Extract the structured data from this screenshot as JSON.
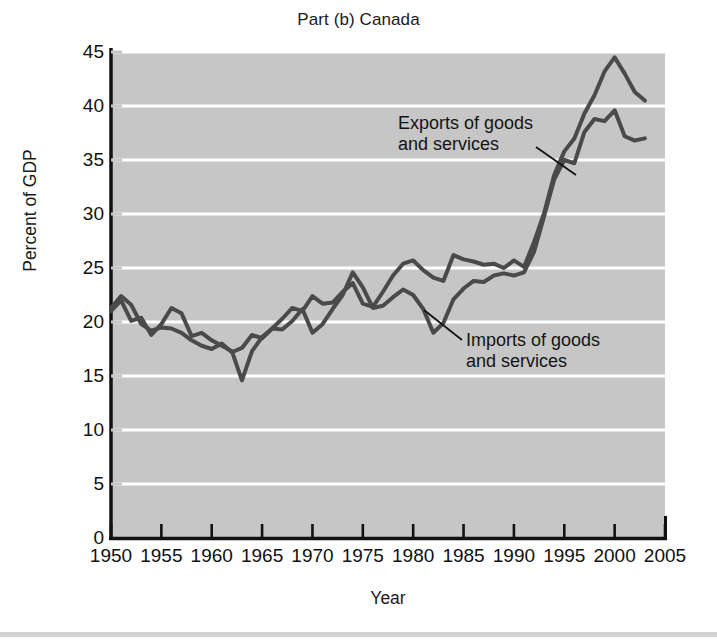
{
  "figure": {
    "title": "Part (b) Canada",
    "footer_strip_color": "#d2d2d2",
    "background_color": "#ffffff"
  },
  "annotations": {
    "exports_line1": "Exports of goods",
    "exports_line2": "and services",
    "imports_line1": "Imports of goods",
    "imports_line2": "and services"
  },
  "chart_data": {
    "type": "line",
    "title": "Part (b) Canada",
    "xlabel": "Year",
    "ylabel": "Percent of GDP",
    "xlim": [
      1950,
      2005
    ],
    "ylim": [
      0,
      45
    ],
    "xticks": [
      1950,
      1955,
      1960,
      1965,
      1970,
      1975,
      1980,
      1985,
      1990,
      1995,
      2000,
      2005
    ],
    "yticks": [
      0,
      5,
      10,
      15,
      20,
      25,
      30,
      35,
      40,
      45
    ],
    "xtick_labels": [
      "1950",
      "1955",
      "1960",
      "1965",
      "1970",
      "1975",
      "1980",
      "1985",
      "1990",
      "1995",
      "2000",
      "2005"
    ],
    "ytick_labels": [
      "0",
      "5",
      "10",
      "15",
      "20",
      "25",
      "30",
      "35",
      "40",
      "45"
    ],
    "grid": true,
    "grid_color": "#ffffff",
    "grid_axis": "y",
    "plot_background": "#c6c6c6",
    "line_color": "#4a4a4a",
    "line_width": 4,
    "legend_position": "inline-annotations",
    "x": [
      1950,
      1951,
      1952,
      1953,
      1954,
      1955,
      1956,
      1957,
      1958,
      1959,
      1960,
      1961,
      1962,
      1963,
      1964,
      1965,
      1966,
      1967,
      1968,
      1969,
      1970,
      1971,
      1972,
      1973,
      1974,
      1975,
      1976,
      1977,
      1978,
      1979,
      1980,
      1981,
      1982,
      1983,
      1984,
      1985,
      1986,
      1987,
      1988,
      1989,
      1990,
      1991,
      1992,
      1993,
      1994,
      1995,
      1996,
      1997,
      1998,
      1999,
      2000,
      2001,
      2002,
      2003
    ],
    "series": [
      {
        "name": "Exports of goods and services",
        "values": [
          21.3,
          22.4,
          21.6,
          19.8,
          19.2,
          19.5,
          19.4,
          19.0,
          18.3,
          17.8,
          17.5,
          18.0,
          17.2,
          17.6,
          18.8,
          18.5,
          19.4,
          20.3,
          21.3,
          21.0,
          22.4,
          21.7,
          21.8,
          22.8,
          23.6,
          21.7,
          21.4,
          22.8,
          24.3,
          25.4,
          25.7,
          24.8,
          24.1,
          23.8,
          26.2,
          25.8,
          25.6,
          25.3,
          25.4,
          25.0,
          25.7,
          25.1,
          27.4,
          30.1,
          33.6,
          35.8,
          37.0,
          39.3,
          41.0,
          43.2,
          44.5,
          43.0,
          41.3,
          40.5
        ]
      },
      {
        "name": "Imports of goods and services",
        "values": [
          21.0,
          22.0,
          20.1,
          20.4,
          18.8,
          19.8,
          21.3,
          20.8,
          18.7,
          19.0,
          18.3,
          17.8,
          17.3,
          14.6,
          17.3,
          18.6,
          19.4,
          19.3,
          20.1,
          21.2,
          19.0,
          19.8,
          21.2,
          22.5,
          24.6,
          23.2,
          21.3,
          21.5,
          22.3,
          23.0,
          22.5,
          21.2,
          19.0,
          19.9,
          22.1,
          23.1,
          23.8,
          23.7,
          24.3,
          24.5,
          24.3,
          24.6,
          26.5,
          29.8,
          33.2,
          35.0,
          34.7,
          37.6,
          38.8,
          38.6,
          39.6,
          37.2,
          36.8,
          37.0
        ]
      }
    ]
  }
}
